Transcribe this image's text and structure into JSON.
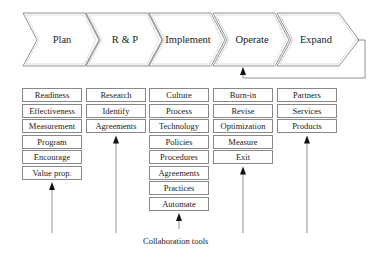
{
  "stages": [
    {
      "label": "Plan"
    },
    {
      "label": "R & P"
    },
    {
      "label": "Implement"
    },
    {
      "label": "Operate"
    },
    {
      "label": "Expand"
    }
  ],
  "columns": [
    {
      "stage": "Plan",
      "items": [
        "Readiness",
        "Effectiveness",
        "Measurement",
        "Program",
        "Encourage",
        "Value prop."
      ]
    },
    {
      "stage": "R & P",
      "items": [
        "Research",
        "Identify",
        "Agreements"
      ]
    },
    {
      "stage": "Implement",
      "items": [
        "Culture",
        "Process",
        "Technology",
        "Policies",
        "Procedures",
        "Agreements",
        "Practices",
        "Automate"
      ]
    },
    {
      "stage": "Operate",
      "items": [
        "Burn-in",
        "Revise",
        "Optimization",
        "Measure",
        "Exit"
      ]
    },
    {
      "stage": "Expand",
      "items": [
        "Partners",
        "Services",
        "Products"
      ]
    }
  ],
  "caption": "Collaboration tools",
  "feedback_loop": {
    "from": "Expand",
    "to": "Operate"
  },
  "colors": {
    "stroke": "#777777",
    "text": "#222222",
    "background": "#ffffff"
  }
}
